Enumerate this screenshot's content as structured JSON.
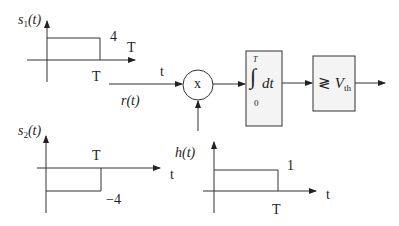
{
  "diagram": {
    "type": "matched-filter / correlator receiver block diagram",
    "signals": {
      "s1": {
        "label": "s",
        "sub": "1",
        "arg": "(t)",
        "amplitude_label": "4",
        "time_label_top": "T",
        "time_label_bottom": "T",
        "axis_label": "t"
      },
      "s2": {
        "label": "s",
        "sub": "2",
        "arg": "(t)",
        "amplitude_label": "−4",
        "time_label": "T",
        "axis_label": "t"
      },
      "h": {
        "label": "h(t)",
        "amplitude_label": "1",
        "time_label": "T",
        "axis_label": "t"
      }
    },
    "input": {
      "label": "r(t)"
    },
    "multiplier": {
      "symbol": "x"
    },
    "integrator": {
      "upper_limit": "T",
      "lower_limit": "0",
      "symbol": "∫",
      "body": "dt"
    },
    "threshold": {
      "comparator": "≷",
      "symbol": "V",
      "sub": "th"
    },
    "colors": {
      "stroke": "#333333",
      "box_fill": "#f2f2f2",
      "background": "#ffffff"
    }
  }
}
